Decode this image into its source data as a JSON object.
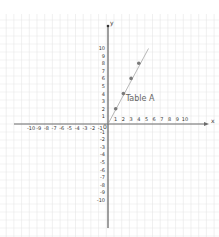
{
  "chart_data": {
    "type": "scatter",
    "title": "",
    "xlabel": "x",
    "ylabel": "y",
    "xlim": [
      -10,
      10
    ],
    "ylim": [
      -10,
      10
    ],
    "grid": true,
    "legend": null,
    "x_ticks": [
      "-10",
      "-9",
      "-8",
      "-7",
      "-6",
      "-5",
      "-4",
      "-3",
      "-2",
      "-1",
      "1",
      "2",
      "3",
      "4",
      "5",
      "6",
      "7",
      "8",
      "9",
      "10"
    ],
    "y_ticks": [
      "10",
      "9",
      "8",
      "7",
      "6",
      "5",
      "4",
      "3",
      "2",
      "1",
      "-1",
      "-2",
      "-3",
      "-4",
      "-5",
      "-6",
      "-7",
      "-8",
      "-9",
      "-10"
    ],
    "origin_label": "0",
    "series": [
      {
        "name": "Table A",
        "points": [
          {
            "x": 1,
            "y": 2
          },
          {
            "x": 2,
            "y": 4
          },
          {
            "x": 3,
            "y": 6
          },
          {
            "x": 4,
            "y": 8
          }
        ],
        "line": {
          "slope": 2,
          "intercept": 0,
          "x_from": 0,
          "x_to": 5
        }
      }
    ],
    "annotations": [
      {
        "text": "Table A",
        "x": 2.3,
        "y": 3
      }
    ]
  },
  "colors": {
    "axis": "#6b6b6b",
    "grid": "#e6e6e6",
    "points": "#7a7a7a",
    "line": "#9a9a9a"
  }
}
